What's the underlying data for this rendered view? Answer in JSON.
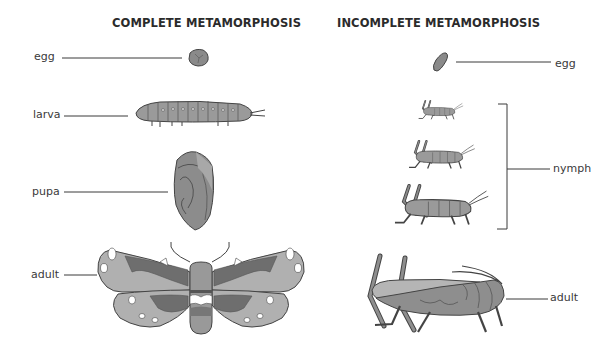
{
  "titles": {
    "complete": "COMPLETE METAMORPHOSIS",
    "incomplete": "INCOMPLETE METAMORPHOSIS"
  },
  "complete": {
    "stages": [
      {
        "label": "egg"
      },
      {
        "label": "larva"
      },
      {
        "label": "pupa"
      },
      {
        "label": "adult"
      }
    ]
  },
  "incomplete": {
    "stages": [
      {
        "label": "egg"
      },
      {
        "label": "nymph"
      },
      {
        "label": "adult"
      }
    ]
  },
  "colors": {
    "background": "#ffffff",
    "text": "#333333",
    "line": "#3a3a3a",
    "fill_light": "#b8b8b8",
    "fill_mid": "#8e8e8e",
    "fill_dark": "#6e6e6e"
  }
}
